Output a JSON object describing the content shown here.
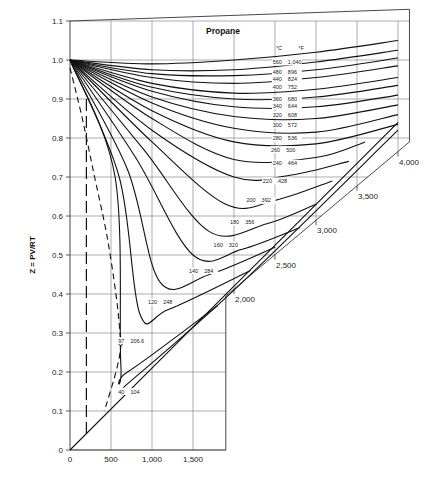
{
  "chart_data": {
    "type": "line",
    "title": "Propane",
    "xlabel": "",
    "ylabel": "Z = PV/RT",
    "xlim": [
      0,
      4000
    ],
    "ylim": [
      0,
      1.1
    ],
    "grid": true,
    "x_ticks": [
      "0",
      "500",
      "1,000",
      "1,500",
      "2,000",
      "2,500",
      "3,000",
      "3,500",
      "4,000"
    ],
    "x_tick_values": [
      0,
      500,
      1000,
      1500,
      2000,
      2500,
      3000,
      3500,
      4000
    ],
    "y_ticks": [
      "0",
      "0.1",
      "0.2",
      "0.3",
      "0.4",
      "0.5",
      "0.6",
      "0.7",
      "0.8",
      "0.9",
      "1.0",
      "1.1"
    ],
    "y_tick_values": [
      0,
      0.1,
      0.2,
      0.3,
      0.4,
      0.5,
      0.6,
      0.7,
      0.8,
      0.9,
      1.0,
      1.1
    ],
    "legend": {
      "celsius_header": "°C",
      "fahrenheit_header": "°F",
      "placement": "top-right"
    },
    "series": [
      {
        "name": "560 °C / 1,040 °F",
        "c": "560",
        "f": "1,040",
        "x": [
          0,
          1000,
          2000,
          3000,
          4000
        ],
        "y": [
          1.0,
          0.99,
          1.0,
          1.02,
          1.05
        ]
      },
      {
        "name": "480 °C / 896 °F",
        "c": "480",
        "f": "896",
        "x": [
          0,
          1000,
          2000,
          3000,
          4000
        ],
        "y": [
          1.0,
          0.975,
          0.975,
          0.995,
          1.025
        ]
      },
      {
        "name": "440 °C / 824 °F",
        "c": "440",
        "f": "824",
        "x": [
          0,
          1000,
          2000,
          3000,
          4000
        ],
        "y": [
          1.0,
          0.965,
          0.96,
          0.975,
          1.005
        ]
      },
      {
        "name": "400 °C / 752 °F",
        "c": "400",
        "f": "752",
        "x": [
          0,
          1000,
          2000,
          3000,
          4000
        ],
        "y": [
          1.0,
          0.955,
          0.94,
          0.955,
          0.985
        ]
      },
      {
        "name": "360 °C / 680 °F",
        "c": "360",
        "f": "680",
        "x": [
          0,
          1000,
          2000,
          3000,
          4000
        ],
        "y": [
          1.0,
          0.94,
          0.915,
          0.925,
          0.955
        ]
      },
      {
        "name": "340 °C / 644 °F",
        "c": "340",
        "f": "644",
        "x": [
          0,
          1000,
          2000,
          3000,
          4000
        ],
        "y": [
          1.0,
          0.93,
          0.9,
          0.905,
          0.935
        ]
      },
      {
        "name": "320 °C / 608 °F",
        "c": "320",
        "f": "608",
        "x": [
          0,
          1000,
          2000,
          3000,
          4000
        ],
        "y": [
          1.0,
          0.92,
          0.88,
          0.88,
          0.91
        ]
      },
      {
        "name": "300 °C / 572 °F",
        "c": "300",
        "f": "572",
        "x": [
          0,
          1000,
          2000,
          3000,
          4000
        ],
        "y": [
          1.0,
          0.905,
          0.855,
          0.85,
          0.885
        ]
      },
      {
        "name": "280 °C / 536 °F",
        "c": "280",
        "f": "536",
        "x": [
          0,
          1000,
          2000,
          3000,
          4000
        ],
        "y": [
          1.0,
          0.89,
          0.825,
          0.815,
          0.86
        ]
      },
      {
        "name": "260 °C / 500 °F",
        "c": "260",
        "f": "500",
        "x": [
          0,
          1000,
          2000,
          3000,
          4000
        ],
        "y": [
          1.0,
          0.87,
          0.79,
          0.785,
          0.835
        ]
      },
      {
        "name": "240 °C / 464 °F",
        "c": "240",
        "f": "464",
        "x": [
          0,
          1000,
          2000,
          3000,
          3600
        ],
        "y": [
          1.0,
          0.85,
          0.745,
          0.75,
          0.79
        ]
      },
      {
        "name": "220 °C / 428 °F",
        "c": "220",
        "f": "428",
        "x": [
          0,
          1000,
          2000,
          2700,
          3400
        ],
        "y": [
          1.0,
          0.82,
          0.7,
          0.705,
          0.74
        ]
      },
      {
        "name": "200 °C / 392 °F",
        "c": "200",
        "f": "392",
        "x": [
          0,
          1000,
          1900,
          2500,
          3200
        ],
        "y": [
          1.0,
          0.79,
          0.63,
          0.64,
          0.69
        ]
      },
      {
        "name": "180 °C / 356 °F",
        "c": "180",
        "f": "356",
        "x": [
          0,
          900,
          1700,
          2400,
          3000
        ],
        "y": [
          1.0,
          0.77,
          0.56,
          0.58,
          0.63
        ]
      },
      {
        "name": "160 °C / 320 °F",
        "c": "160",
        "f": "320",
        "x": [
          0,
          800,
          1500,
          2100,
          2800
        ],
        "y": [
          1.0,
          0.75,
          0.5,
          0.515,
          0.57
        ]
      },
      {
        "name": "140 °C / 284 °F",
        "c": "140",
        "f": "284",
        "x": [
          0,
          700,
          1100,
          1700,
          2500
        ],
        "y": [
          1.0,
          0.72,
          0.43,
          0.45,
          0.52
        ]
      },
      {
        "name": "120 °C / 248 °F",
        "c": "120",
        "f": "248",
        "x": [
          0,
          600,
          850,
          1200,
          2200
        ],
        "y": [
          1.0,
          0.7,
          0.35,
          0.36,
          0.46
        ]
      },
      {
        "name": "97 °C / 206.6 °F",
        "c": "97",
        "f": "206.6",
        "x": [
          0,
          550,
          620,
          700,
          1800
        ],
        "y": [
          1.0,
          0.7,
          0.22,
          0.2,
          0.37
        ]
      },
      {
        "name": "40 °C / 104 °F",
        "c": "40",
        "f": "104",
        "x": [
          0,
          2000,
          4000
        ],
        "y": [
          0.0,
          0.42,
          0.84
        ]
      },
      {
        "name": "40 °C / 104 °F (label line)",
        "c": "40",
        "f": "104",
        "x": [
          650,
          2000,
          4000
        ],
        "y": [
          0.16,
          0.41,
          0.82
        ]
      }
    ],
    "saturation_curve": {
      "name": "Two-phase boundary (dashed)",
      "x": [
        0,
        150,
        300,
        450,
        560,
        610,
        617,
        560,
        420
      ],
      "y": [
        0.98,
        0.85,
        0.7,
        0.55,
        0.4,
        0.3,
        0.26,
        0.2,
        0.1
      ]
    },
    "dashed_vertical": {
      "x": 200,
      "y": [
        0.03,
        0.9
      ]
    },
    "critical_point": {
      "x": 617,
      "y": 0.275
    },
    "x_ticks_diagonal": [
      {
        "label": "2,000",
        "value": 2000
      },
      {
        "label": "2,500",
        "value": 2500
      },
      {
        "label": "3,000",
        "value": 3000
      },
      {
        "label": "3,500",
        "value": 3500
      },
      {
        "label": "4,000",
        "value": 4000
      }
    ]
  }
}
